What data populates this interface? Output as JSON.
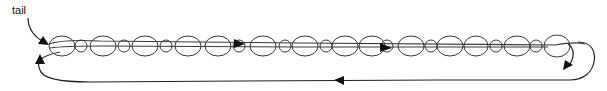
{
  "diagram": {
    "type": "linked-list-loop",
    "labels": {
      "tail": "tail"
    },
    "colors": {
      "stroke": "#3a3a3a",
      "arrow": "#111111",
      "background": "#ffffff"
    },
    "beads": [
      {
        "cx": 62,
        "rx": 13,
        "ry": 10,
        "size": "large"
      },
      {
        "cx": 81,
        "rx": 6,
        "ry": 6,
        "size": "small"
      },
      {
        "cx": 103,
        "rx": 13,
        "ry": 10,
        "size": "large"
      },
      {
        "cx": 124,
        "rx": 6,
        "ry": 6,
        "size": "small"
      },
      {
        "cx": 145,
        "rx": 13,
        "ry": 10,
        "size": "large"
      },
      {
        "cx": 166,
        "rx": 6,
        "ry": 6,
        "size": "small"
      },
      {
        "cx": 188,
        "rx": 13,
        "ry": 10,
        "size": "large"
      },
      {
        "cx": 218,
        "rx": 13,
        "ry": 10,
        "size": "large"
      },
      {
        "cx": 239,
        "rx": 6,
        "ry": 6,
        "size": "small"
      },
      {
        "cx": 263,
        "rx": 13,
        "ry": 10,
        "size": "large"
      },
      {
        "cx": 285,
        "rx": 6,
        "ry": 6,
        "size": "small"
      },
      {
        "cx": 305,
        "rx": 13,
        "ry": 10,
        "size": "large"
      },
      {
        "cx": 326,
        "rx": 6,
        "ry": 6,
        "size": "small"
      },
      {
        "cx": 345,
        "rx": 13,
        "ry": 10,
        "size": "large"
      },
      {
        "cx": 372,
        "rx": 13,
        "ry": 10,
        "size": "large"
      },
      {
        "cx": 387,
        "rx": 6,
        "ry": 6,
        "size": "small"
      },
      {
        "cx": 411,
        "rx": 13,
        "ry": 10,
        "size": "large"
      },
      {
        "cx": 431,
        "rx": 6,
        "ry": 6,
        "size": "small"
      },
      {
        "cx": 450,
        "rx": 13,
        "ry": 10,
        "size": "large"
      },
      {
        "cx": 476,
        "rx": 12,
        "ry": 10,
        "size": "large"
      },
      {
        "cx": 496,
        "rx": 6,
        "ry": 6,
        "size": "small"
      },
      {
        "cx": 517,
        "rx": 13,
        "ry": 10,
        "size": "large"
      },
      {
        "cx": 536,
        "rx": 6,
        "ry": 6,
        "size": "small"
      },
      {
        "cx": 557,
        "rx": 13,
        "ry": 11,
        "size": "large"
      }
    ],
    "arrows": [
      {
        "name": "tail-pointer-arrow",
        "direction": "down-right"
      },
      {
        "name": "forward-arrow-1",
        "x": 240,
        "direction": "right"
      },
      {
        "name": "forward-arrow-2",
        "x": 384,
        "direction": "right"
      },
      {
        "name": "wrap-around-arrow",
        "direction": "down-left"
      },
      {
        "name": "return-arrow",
        "x": 340,
        "direction": "left"
      },
      {
        "name": "loop-back-arrow",
        "direction": "up"
      }
    ]
  }
}
